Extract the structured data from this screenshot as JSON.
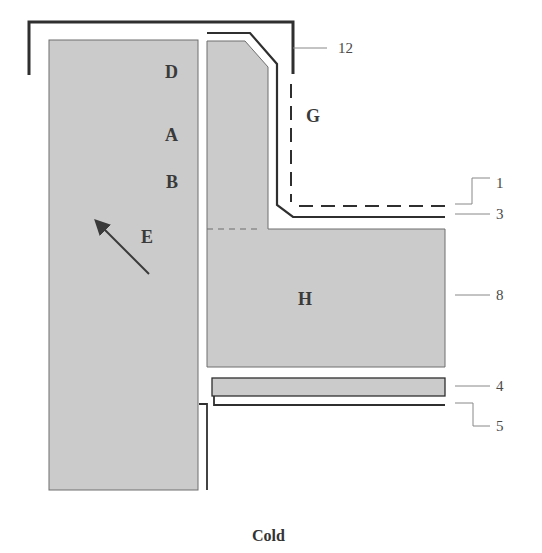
{
  "diagram": {
    "caption": "Cold",
    "colors": {
      "fill": "#cbcbcb",
      "outline": "#6e6e6e",
      "line": "#2f2f2f",
      "leader": "#888888",
      "background": "#ffffff"
    },
    "region_labels": {
      "D": "D",
      "A": "A",
      "B": "B",
      "E": "E",
      "G": "G",
      "H": "H"
    },
    "callouts": {
      "c12": "12",
      "c1": "1",
      "c3": "3",
      "c8": "8",
      "c4": "4",
      "c5": "5"
    },
    "arrow": {
      "direction": "up-left",
      "label": "E"
    }
  }
}
